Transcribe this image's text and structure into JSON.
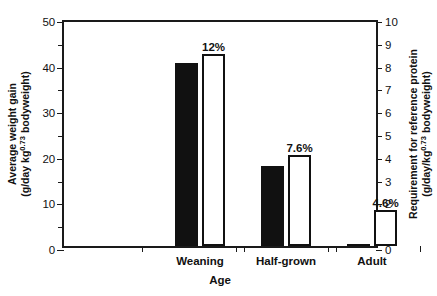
{
  "chart_data": {
    "type": "bar",
    "title": "",
    "categories": [
      "Weaning",
      "Half-grown",
      "Adult"
    ],
    "xlabel": "Age",
    "ylabel_left_line1": "Average weight gain",
    "ylabel_left_line2_pre": "(g/day kg",
    "ylabel_left_line2_sup": "0.73",
    "ylabel_left_line2_post": " bodyweight)",
    "ylabel_right_line1": "Requirement for reference protein",
    "ylabel_right_line2_pre": "(g/day/kg",
    "ylabel_right_line2_sup": "0.73",
    "ylabel_right_line2_post": " bodyweight)",
    "ylim_left": [
      0,
      50
    ],
    "ylim_right": [
      0,
      10
    ],
    "yticks_left": [
      0,
      5,
      10,
      15,
      20,
      25,
      30,
      35,
      40,
      45,
      50
    ],
    "yticklabels_left": [
      "0",
      "",
      "10",
      "",
      "20",
      "",
      "30",
      "",
      "40",
      "",
      "50"
    ],
    "yticks_right": [
      0,
      1,
      2,
      3,
      4,
      5,
      6,
      7,
      8,
      9,
      10
    ],
    "yticklabels_right": [
      "0",
      "1",
      "2",
      "3",
      "4",
      "5",
      "6",
      "7",
      "8",
      "9",
      "10"
    ],
    "grid": false,
    "legend": "none",
    "series": [
      {
        "name": "Average weight gain",
        "style": "filled",
        "axis": "left",
        "values": [
          40.2,
          17.5,
          0.5
        ]
      },
      {
        "name": "Requirement for reference protein",
        "style": "open",
        "axis": "right",
        "values": [
          8.4,
          4.0,
          1.6
        ]
      }
    ],
    "annotations": [
      "12%",
      "7.6%",
      "4.6%"
    ]
  },
  "figure": {
    "bars": [
      {
        "group": "Weaning",
        "filled_label": "",
        "filled_value": 40.2,
        "open_value": 8.4,
        "pct": "12%"
      },
      {
        "group": "Half-grown",
        "filled_label": "",
        "filled_value": 17.5,
        "open_value": 4.0,
        "pct": "7.6%"
      },
      {
        "group": "Adult",
        "filled_label": "",
        "filled_value": 0.5,
        "open_value": 1.6,
        "pct": "4.6%"
      }
    ],
    "colors": {
      "bar_filled": "#111111",
      "bar_open_fill": "#ffffff",
      "bar_open_edge": "#111111",
      "axis": "#1a1a1a",
      "background": "#ffffff"
    }
  }
}
